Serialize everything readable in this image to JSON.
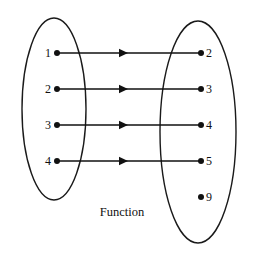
{
  "diagram": {
    "caption": "Function",
    "caption_x": 122,
    "caption_y": 216,
    "background_color": "#ffffff",
    "stroke_color": "#1a1a1a",
    "dot_color": "#111111",
    "domain_ellipse": {
      "name": "domain-set",
      "cx": 54,
      "cy": 109,
      "rx": 32,
      "ry": 91
    },
    "codomain_ellipse": {
      "name": "codomain-set",
      "cx": 198,
      "cy": 132,
      "rx": 38,
      "ry": 111
    },
    "domain_nodes": [
      {
        "label": "1",
        "x": 57,
        "y": 53
      },
      {
        "label": "2",
        "x": 57,
        "y": 89
      },
      {
        "label": "3",
        "x": 57,
        "y": 125
      },
      {
        "label": "4",
        "x": 57,
        "y": 161
      }
    ],
    "codomain_nodes": [
      {
        "label": "2",
        "x": 201,
        "y": 53
      },
      {
        "label": "3",
        "x": 201,
        "y": 89
      },
      {
        "label": "4",
        "x": 201,
        "y": 125
      },
      {
        "label": "5",
        "x": 201,
        "y": 161
      },
      {
        "label": "9",
        "x": 201,
        "y": 197
      }
    ],
    "mappings": [
      {
        "from": "1",
        "to": "2",
        "y": 53,
        "x1": 58,
        "x2": 200,
        "head_x": 128
      },
      {
        "from": "2",
        "to": "3",
        "y": 89,
        "x1": 58,
        "x2": 200,
        "head_x": 128
      },
      {
        "from": "3",
        "to": "4",
        "y": 125,
        "x1": 58,
        "x2": 200,
        "head_x": 128
      },
      {
        "from": "4",
        "to": "5",
        "y": 161,
        "x1": 58,
        "x2": 200,
        "head_x": 128
      }
    ],
    "dot_radius": 3,
    "unmapped_codomain_label": "9"
  }
}
